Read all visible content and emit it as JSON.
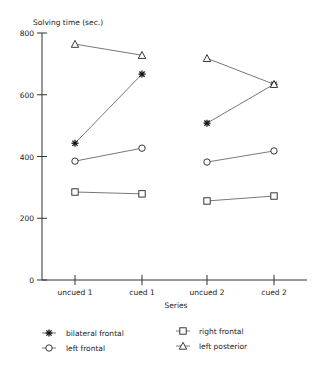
{
  "chart_data": {
    "type": "line",
    "title": "",
    "ylabel": "Solving time (sec.)",
    "xlabel": "Series",
    "ylim": [
      0,
      800
    ],
    "yticks": [
      0,
      200,
      400,
      600,
      800
    ],
    "grid": false,
    "legend_position": "bottom",
    "categories": [
      "uncued 1",
      "cued 1",
      "uncued 2",
      "cued 2"
    ],
    "segments": [
      [
        0,
        1
      ],
      [
        2,
        3
      ]
    ],
    "series": [
      {
        "name": "bilateral frontal",
        "marker": "asterisk",
        "values": [
          443,
          667,
          508,
          634
        ]
      },
      {
        "name": "left frontal",
        "marker": "circle",
        "values": [
          385,
          427,
          382,
          418
        ]
      },
      {
        "name": "right frontal",
        "marker": "square",
        "values": [
          285,
          279,
          256,
          272
        ]
      },
      {
        "name": "left posterior",
        "marker": "triangle",
        "values": [
          764,
          728,
          718,
          634
        ]
      }
    ]
  },
  "labels": {
    "ylabel": "Solving time (sec.)",
    "xlabel": "Series",
    "yticks": [
      "0",
      "200",
      "400",
      "600",
      "800"
    ],
    "xticks": [
      "uncued 1",
      "cued 1",
      "uncued 2",
      "cued 2"
    ],
    "legend": [
      "bilateral frontal",
      "left frontal",
      "right frontal",
      "left posterior"
    ]
  }
}
